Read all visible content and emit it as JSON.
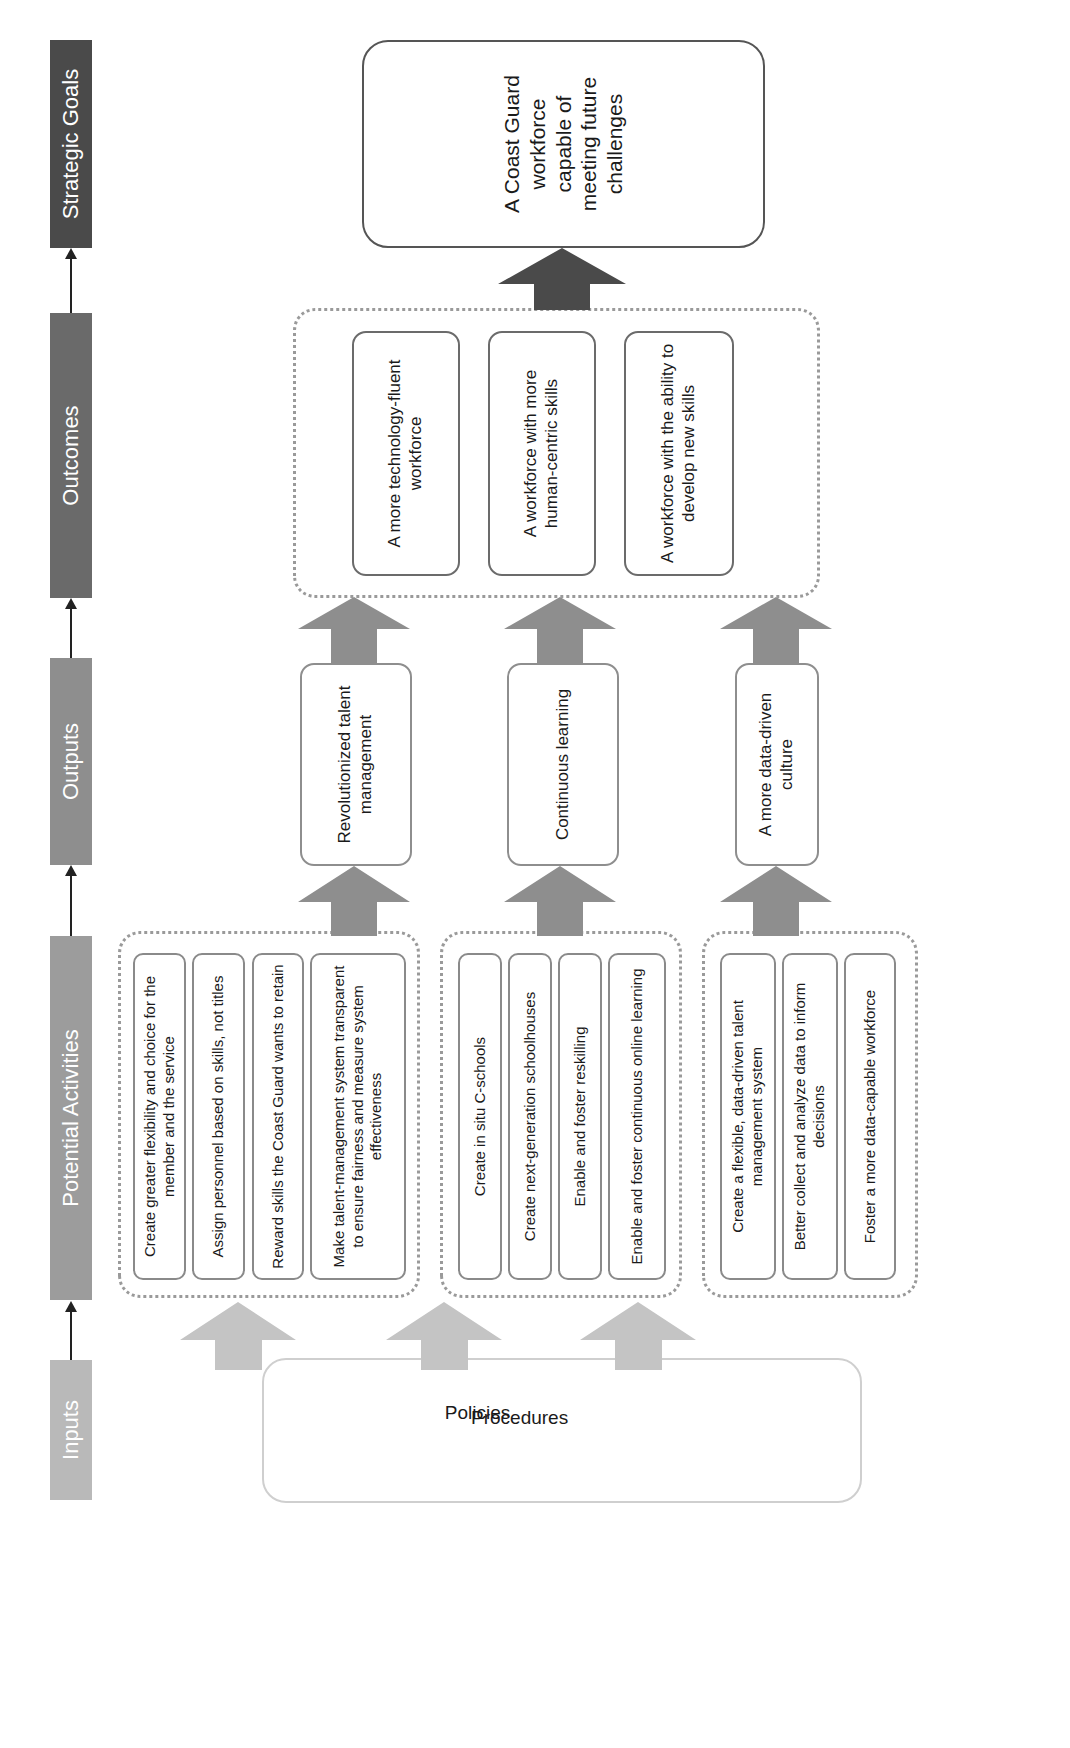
{
  "diagram": {
    "orientation": "rotated 90 degrees counter-clockwise (reads bottom to top)",
    "colors": {
      "inputs_bar": "#b9b9b9",
      "activities_bar": "#9c9c9c",
      "outputs_bar": "#8e8e8e",
      "outcomes_bar": "#6a6a6a",
      "goals_bar": "#4a4a4a",
      "input_arrow": "#c4c4c4",
      "output_arrow": "#8e8e8e",
      "outcome_arrow": "#727272",
      "goal_arrow": "#4a4a4a"
    }
  },
  "stages": [
    {
      "label": "Inputs"
    },
    {
      "label": "Potential Activities"
    },
    {
      "label": "Outputs"
    },
    {
      "label": "Outcomes"
    },
    {
      "label": "Strategic Goals"
    }
  ],
  "inputs": {
    "items": [
      "Policies",
      "Procedures",
      "Plans",
      "Cultural values",
      "Rewards"
    ],
    "cultural_line1": "Cultural",
    "cultural_line2": "values"
  },
  "activity_groups": [
    {
      "activities": [
        "Create greater flexibility and choice for the member and the service",
        "Assign personnel based on skills, not titles",
        "Reward skills the Coast Guard wants to retain",
        "Make talent-management system transparent to ensure fairness and measure system effectiveness"
      ]
    },
    {
      "activities": [
        "Create in situ C-schools",
        "Create next-generation schoolhouses",
        "Enable and foster reskilling",
        "Enable and foster continuous online learning"
      ]
    },
    {
      "activities": [
        "Create a flexible, data-driven talent management system",
        "Better collect and analyze data to inform decisions",
        "Foster a more data-capable workforce"
      ]
    }
  ],
  "outputs": [
    {
      "label": "Revolutionized talent management"
    },
    {
      "label": "Continuous learning"
    },
    {
      "label": "A more data-driven culture"
    }
  ],
  "outcomes": [
    {
      "label": "A more technology-fluent workforce"
    },
    {
      "label": "A workforce with more human-centric skills"
    },
    {
      "label": "A workforce with the ability to develop new skills"
    }
  ],
  "strategic_goal": {
    "label": "A Coast Guard workforce capable of meeting future challenges"
  }
}
